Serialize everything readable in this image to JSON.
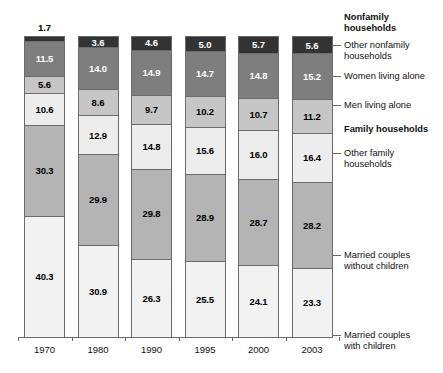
{
  "chart_data": {
    "type": "bar",
    "subtype": "stacked-bar-100",
    "title": "",
    "xlabel": "",
    "ylabel": "",
    "ylim": [
      0,
      100
    ],
    "grid": false,
    "legend_position": "right-leader-lines",
    "categories": [
      "1970",
      "1980",
      "1990",
      "1995",
      "2000",
      "2003"
    ],
    "series": [
      {
        "name": "Other nonfamily households",
        "group": "Nonfamily households",
        "color": "#333333",
        "values": [
          1.7,
          3.6,
          4.6,
          5.0,
          5.7,
          5.6
        ]
      },
      {
        "name": "Women living alone",
        "group": "Nonfamily households",
        "color": "#7e7e7e",
        "values": [
          11.5,
          14.0,
          14.9,
          14.7,
          14.8,
          15.2
        ]
      },
      {
        "name": "Men living alone",
        "group": "Nonfamily households",
        "color": "#c6c6c6",
        "values": [
          5.6,
          8.6,
          9.7,
          10.2,
          10.7,
          11.2
        ]
      },
      {
        "name": "Other family households",
        "group": "Family households",
        "color": "#ededed",
        "values": [
          10.6,
          12.9,
          14.8,
          15.6,
          16.0,
          16.4
        ]
      },
      {
        "name": "Married couples without children",
        "group": "Family households",
        "color": "#b4b4b4",
        "values": [
          30.3,
          29.9,
          29.8,
          28.9,
          28.7,
          28.2
        ]
      },
      {
        "name": "Married couples with children",
        "group": "Family households",
        "color": "#f2f2f2",
        "values": [
          40.3,
          30.9,
          26.3,
          25.5,
          24.1,
          23.3
        ]
      }
    ]
  },
  "legend": {
    "entries": [
      {
        "label": "Nonfamily\nhouseholds",
        "is_header": true,
        "has_leader": false
      },
      {
        "label": "Other nonfamily\nhouseholds",
        "is_header": false,
        "has_leader": true
      },
      {
        "label": "Women living alone",
        "is_header": false,
        "has_leader": true
      },
      {
        "label": "Men living alone",
        "is_header": false,
        "has_leader": true
      },
      {
        "label": "Family households",
        "is_header": true,
        "has_leader": false
      },
      {
        "label": "Other family\nhouseholds",
        "is_header": false,
        "has_leader": true
      },
      {
        "label": "Married couples\nwithout children",
        "is_header": false,
        "has_leader": true
      },
      {
        "label": "Married couples\nwith children",
        "is_header": false,
        "has_leader": true
      }
    ]
  }
}
